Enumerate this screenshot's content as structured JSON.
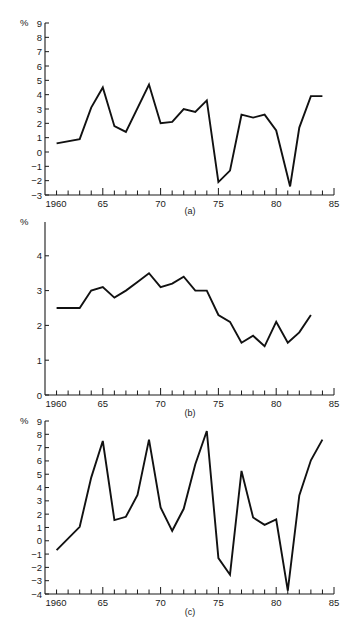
{
  "chart_data": [
    {
      "type": "line",
      "panel_label": "(a)",
      "title": "",
      "xlabel": "",
      "ylabel": "%",
      "xlim": [
        1960,
        1985
      ],
      "ylim": [
        -3,
        9
      ],
      "x_ticks": [
        "1960",
        "65",
        "70",
        "75",
        "80",
        "85"
      ],
      "y_ticks": [
        "9",
        "8",
        "7",
        "6",
        "5",
        "4",
        "3",
        "2",
        "1",
        "0",
        "-1",
        "-2",
        "-3"
      ],
      "grid": false,
      "x": [
        1961,
        1963,
        1964,
        1965,
        1966,
        1967,
        1969,
        1970,
        1971,
        1972,
        1973,
        1974,
        1975,
        1976,
        1977,
        1978,
        1979,
        1980,
        1981.2,
        1982,
        1983,
        1984
      ],
      "values": [
        0.6,
        0.9,
        3.1,
        4.5,
        1.8,
        1.4,
        4.7,
        2.0,
        2.1,
        3.0,
        2.8,
        3.6,
        -2.1,
        -1.3,
        2.6,
        2.4,
        2.6,
        1.5,
        -2.4,
        1.7,
        3.9,
        3.9
      ]
    },
    {
      "type": "line",
      "panel_label": "(b)",
      "title": "",
      "xlabel": "",
      "ylabel": "%",
      "xlim": [
        1960,
        1985
      ],
      "ylim": [
        0,
        5
      ],
      "x_ticks": [
        "1960",
        "65",
        "70",
        "75",
        "80",
        "85"
      ],
      "y_ticks": [
        "4",
        "3",
        "2",
        "1",
        "0"
      ],
      "grid": false,
      "x": [
        1961,
        1963,
        1964,
        1965,
        1966,
        1967,
        1968,
        1969,
        1970,
        1971,
        1972,
        1973,
        1974,
        1975,
        1976,
        1977,
        1978,
        1979,
        1980,
        1981,
        1982,
        1983
      ],
      "values": [
        2.5,
        2.5,
        3.0,
        3.1,
        2.8,
        3.0,
        3.25,
        3.5,
        3.1,
        3.2,
        3.4,
        3.0,
        3.0,
        2.3,
        2.1,
        1.5,
        1.7,
        1.4,
        2.1,
        1.5,
        1.8,
        2.3
      ]
    },
    {
      "type": "line",
      "panel_label": "(c)",
      "title": "",
      "xlabel": "",
      "ylabel": "%",
      "xlim": [
        1960,
        1985
      ],
      "ylim": [
        -4,
        9
      ],
      "x_ticks": [
        "1960",
        "65",
        "70",
        "75",
        "80",
        "85"
      ],
      "y_ticks": [
        "9",
        "8",
        "7",
        "6",
        "5",
        "4",
        "3",
        "2",
        "1",
        "0",
        "-1",
        "-2",
        "-3",
        "-4"
      ],
      "grid": false,
      "x": [
        1961,
        1963,
        1964,
        1965,
        1966,
        1967,
        1968,
        1969,
        1970,
        1971,
        1972,
        1973,
        1974,
        1975,
        1976,
        1977,
        1978,
        1979,
        1980,
        1981,
        1982,
        1983,
        1984
      ],
      "values": [
        -0.7,
        1.05,
        4.75,
        7.5,
        1.55,
        1.8,
        3.45,
        7.6,
        2.5,
        0.75,
        2.4,
        5.75,
        8.25,
        -1.3,
        -2.55,
        5.25,
        1.75,
        1.2,
        1.6,
        -3.75,
        3.4,
        6.05,
        7.6
      ]
    }
  ]
}
